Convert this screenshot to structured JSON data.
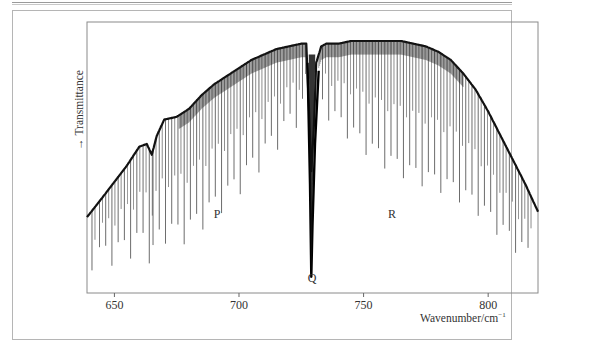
{
  "figure": {
    "branch_labels": {
      "P": "P",
      "Q": "Q",
      "R": "R"
    },
    "x_axis_title": "Wavenumber/cm",
    "x_axis_exponent": "−1",
    "y_axis_title": "Transmittance",
    "y_axis_arrow": "→"
  },
  "chart_data": {
    "type": "line",
    "title": "",
    "xlabel": "Wavenumber/cm−1",
    "ylabel": "Transmittance",
    "xlim": [
      639,
      820
    ],
    "ylim": [
      0,
      1
    ],
    "grid": false,
    "legend": null,
    "x_ticks": [
      650,
      700,
      750,
      800
    ],
    "x_tick_labels": [
      "650",
      "700",
      "750",
      "800"
    ],
    "annotations": [
      {
        "text": "P",
        "x": 691,
        "y": 0.3,
        "note": "P branch"
      },
      {
        "text": "Q",
        "x": 729,
        "y": 0.02,
        "note": "Q branch"
      },
      {
        "text": "R",
        "x": 758,
        "y": 0.3,
        "note": "R branch"
      }
    ],
    "series": [
      {
        "name": "Envelope (upper transmittance)",
        "x": [
          639,
          645,
          650,
          655,
          660,
          663,
          665,
          667,
          670,
          675,
          680,
          685,
          690,
          695,
          700,
          705,
          710,
          715,
          720,
          725,
          727,
          728,
          729,
          730,
          731,
          733,
          735,
          740,
          745,
          750,
          755,
          760,
          765,
          770,
          775,
          780,
          785,
          790,
          795,
          800,
          805,
          810,
          815,
          820
        ],
        "y": [
          0.28,
          0.35,
          0.41,
          0.47,
          0.54,
          0.55,
          0.51,
          0.58,
          0.64,
          0.65,
          0.68,
          0.73,
          0.77,
          0.8,
          0.83,
          0.86,
          0.88,
          0.9,
          0.91,
          0.92,
          0.92,
          0.7,
          0.45,
          0.6,
          0.85,
          0.91,
          0.92,
          0.92,
          0.93,
          0.93,
          0.93,
          0.93,
          0.93,
          0.92,
          0.91,
          0.89,
          0.86,
          0.81,
          0.75,
          0.67,
          0.58,
          0.49,
          0.4,
          0.3
        ]
      },
      {
        "name": "Q branch dip",
        "x": [
          727.5,
          728.5,
          729.0,
          729.5,
          730.5,
          732
        ],
        "y": [
          0.85,
          0.4,
          0.06,
          0.25,
          0.55,
          0.82
        ]
      }
    ],
    "rotational_lines": {
      "P_branch_x": [
        641,
        644,
        646.5,
        649,
        651.5,
        654,
        656.5,
        659,
        661.5,
        664,
        665.5,
        668,
        670.5,
        673,
        675.5,
        678,
        680.5,
        683,
        685.5,
        688,
        690.5,
        693,
        695.5,
        698,
        700.5,
        703,
        705.5,
        708,
        710.5,
        713,
        715.5,
        718,
        720.5,
        723,
        725.5
      ],
      "R_branch_x": [
        733.5,
        736,
        738.5,
        741,
        743.5,
        746,
        748.5,
        751,
        753.5,
        756,
        758.5,
        761,
        763.5,
        766,
        768.5,
        771,
        773.5,
        776,
        778.5,
        781,
        783.5,
        786,
        788.5,
        791,
        793.5,
        796,
        798.5,
        801,
        803.5,
        806,
        808.5,
        811,
        813.5,
        816
      ],
      "note": "Absorption lines dip below the envelope; deepest near band center"
    }
  },
  "plot_frame": {
    "left": 87,
    "right": 538,
    "top": 22,
    "bottom": 293
  }
}
